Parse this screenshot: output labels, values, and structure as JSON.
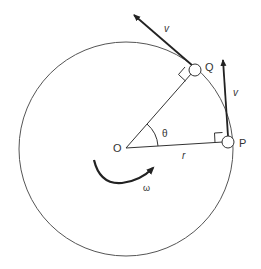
{
  "diagram": {
    "labels": {
      "center": "O",
      "point_p": "P",
      "point_q": "Q",
      "velocity_q": "v",
      "velocity_p": "v",
      "radius": "r",
      "angle": "θ",
      "angular_velocity": "ω"
    },
    "colors": {
      "stroke": "#222222",
      "circle": "#555555",
      "background": "#ffffff"
    }
  }
}
